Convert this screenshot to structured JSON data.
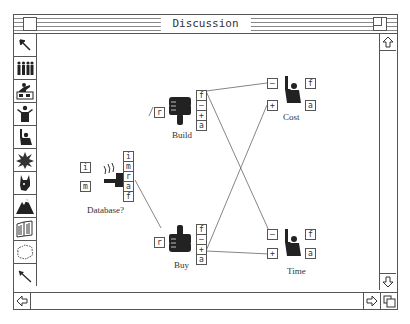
{
  "window": {
    "title": "Discussion"
  },
  "palette": {
    "tools": [
      {
        "name": "pointer-tool"
      },
      {
        "name": "group-tool"
      },
      {
        "name": "presenter-tool"
      },
      {
        "name": "shrug-figure-tool"
      },
      {
        "name": "raised-hand-tool"
      },
      {
        "name": "burst-tool"
      },
      {
        "name": "donkey-tool"
      },
      {
        "name": "mountain-tool"
      },
      {
        "name": "book-tool"
      },
      {
        "name": "cloud-tool"
      },
      {
        "name": "link-arrow-tool"
      }
    ]
  },
  "nodes": {
    "database": {
      "label": "Database?",
      "left_boxes": [
        "i",
        "m"
      ],
      "right_boxes": [
        "i",
        "m",
        "r",
        "a",
        "f"
      ]
    },
    "build": {
      "label": "Build",
      "left_box": "r",
      "right_boxes": [
        "f",
        "–",
        "+",
        "a"
      ]
    },
    "buy": {
      "label": "Buy",
      "left_box": "r",
      "right_boxes": [
        "f",
        "–",
        "+",
        "a"
      ]
    },
    "cost": {
      "label": "Cost",
      "left_boxes": [
        "–",
        "+"
      ],
      "right_boxes": [
        "f",
        "a"
      ]
    },
    "time": {
      "label": "Time",
      "left_boxes": [
        "–",
        "+"
      ],
      "right_boxes": [
        "f",
        "a"
      ]
    }
  },
  "connections": [
    {
      "from": "database.r",
      "to": "buy.r"
    },
    {
      "from": "build.–",
      "to": "cost.–"
    },
    {
      "from": "build.–",
      "to": "time.–"
    },
    {
      "from": "buy.+",
      "to": "cost.+"
    },
    {
      "from": "buy.+",
      "to": "time.+"
    }
  ]
}
